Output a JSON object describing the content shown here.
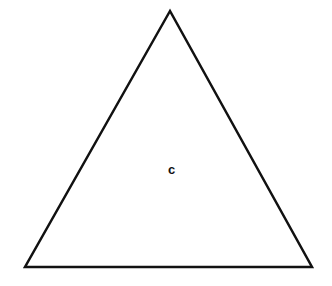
{
  "diagram": {
    "shape": "triangle",
    "type": "equilateral-triangle",
    "stroke_color": "#111111",
    "fill_color": "#ffffff",
    "stroke_width": 2.5,
    "vertices": {
      "apex": [
        170,
        11
      ],
      "bottom_left": [
        25,
        267
      ],
      "bottom_right": [
        312,
        267
      ]
    },
    "center_label": {
      "text": "c",
      "position": [
        172,
        170
      ]
    }
  }
}
